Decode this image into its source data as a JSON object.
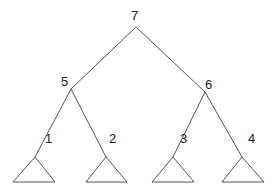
{
  "diagram": {
    "type": "binary-tree",
    "nodes": [
      {
        "id": "7",
        "label": "7",
        "x": 136,
        "y": 27,
        "lx": 131,
        "ly": 20
      },
      {
        "id": "5",
        "label": "5",
        "x": 71,
        "y": 89,
        "lx": 61,
        "ly": 86
      },
      {
        "id": "6",
        "label": "6",
        "x": 205,
        "y": 92,
        "lx": 205,
        "ly": 89
      },
      {
        "id": "1",
        "label": "1",
        "x": 35,
        "y": 157,
        "lx": 45,
        "ly": 143
      },
      {
        "id": "2",
        "label": "2",
        "x": 106,
        "y": 157,
        "lx": 109,
        "ly": 143
      },
      {
        "id": "3",
        "label": "3",
        "x": 173,
        "y": 157,
        "lx": 180,
        "ly": 143
      },
      {
        "id": "4",
        "label": "4",
        "x": 242,
        "y": 157,
        "lx": 248,
        "ly": 143
      }
    ],
    "edges": [
      {
        "from": "7",
        "to": "5"
      },
      {
        "from": "7",
        "to": "6"
      },
      {
        "from": "5",
        "to": "1"
      },
      {
        "from": "5",
        "to": "2"
      },
      {
        "from": "6",
        "to": "3"
      },
      {
        "from": "6",
        "to": "4"
      }
    ],
    "subtrees": [
      {
        "under": "1",
        "apex": [
          35,
          157
        ],
        "left": [
          13,
          182
        ],
        "right": [
          55,
          182
        ]
      },
      {
        "under": "2",
        "apex": [
          106,
          157
        ],
        "left": [
          86,
          182
        ],
        "right": [
          127,
          182
        ]
      },
      {
        "under": "3",
        "apex": [
          173,
          157
        ],
        "left": [
          152,
          182
        ],
        "right": [
          194,
          182
        ]
      },
      {
        "under": "4",
        "apex": [
          242,
          157
        ],
        "left": [
          222,
          182
        ],
        "right": [
          264,
          182
        ]
      }
    ]
  }
}
